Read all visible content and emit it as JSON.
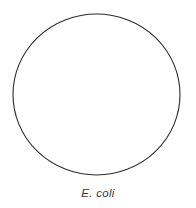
{
  "figure": {
    "type": "biological-cell-outline-diagram",
    "background_color": "#ffffff",
    "width": 196,
    "height": 208,
    "caption": "E. coli",
    "caption_style": "italic",
    "caption_color": "#3a3a3a",
    "shape": {
      "name": "cell-outline",
      "form": "ellipse",
      "filled": false,
      "fill_color": "#ffffff",
      "stroke_color": "#2b2b2b",
      "stroke_width": 1.1,
      "center_x": 96.5,
      "center_y": 94.5,
      "radius_x": 83.5,
      "radius_y": 80.5,
      "left_edge": 13,
      "right_edge": 180,
      "top_edge": 14,
      "bottom_edge": 175
    }
  }
}
